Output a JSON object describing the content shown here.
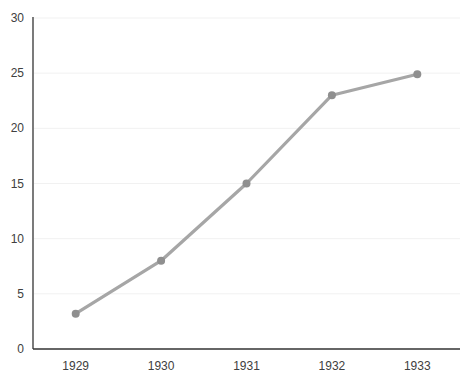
{
  "chart_data": {
    "type": "line",
    "title": "",
    "xlabel": "",
    "ylabel": "",
    "categories": [
      "1929",
      "1930",
      "1931",
      "1932",
      "1933"
    ],
    "series": [
      {
        "name": "series1",
        "values": [
          3.2,
          8,
          15,
          23,
          24.9
        ]
      }
    ],
    "ylim": [
      0,
      30
    ],
    "ytick_step": 5,
    "yticks": [
      0,
      5,
      10,
      15,
      20,
      25,
      30
    ],
    "grid": true,
    "legend": false,
    "colors": {
      "line": "#a6a6a6",
      "marker": "#8f8f8f",
      "axis": "#333333",
      "gridline": "#f1f1f1",
      "text": "#404040",
      "background": "#ffffff"
    }
  }
}
